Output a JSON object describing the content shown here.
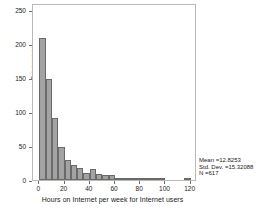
{
  "chart_data": {
    "type": "bar",
    "subtype": "histogram",
    "title": "",
    "xlabel": "Hours on Internet per week for Internet users",
    "ylabel": "Frequency",
    "xlim": [
      -5,
      125
    ],
    "ylim": [
      0,
      260
    ],
    "bin_width": 5,
    "grid": false,
    "legend": null,
    "xticks": [
      0,
      20,
      40,
      60,
      80,
      100,
      120
    ],
    "xtick_labels": [
      "0",
      "20",
      "40",
      "60",
      "80",
      "100",
      "120"
    ],
    "yticks": [
      0,
      50,
      100,
      150,
      200,
      250
    ],
    "ytick_labels": [
      "0",
      "50",
      "100",
      "150",
      "200",
      "250"
    ],
    "bin_starts": [
      0,
      5,
      10,
      15,
      20,
      25,
      30,
      35,
      40,
      45,
      50,
      55,
      60,
      65,
      70,
      75,
      80,
      85,
      90,
      95,
      100,
      105,
      110,
      115,
      120
    ],
    "categories": [
      "0-5",
      "5-10",
      "10-15",
      "15-20",
      "20-25",
      "25-30",
      "30-35",
      "35-40",
      "40-45",
      "45-50",
      "50-55",
      "55-60",
      "60-65",
      "65-70",
      "70-75",
      "75-80",
      "80-85",
      "85-90",
      "90-95",
      "95-100",
      "100-105",
      "105-110",
      "110-115",
      "115-120",
      "120-125"
    ],
    "values": [
      208,
      149,
      91,
      48,
      30,
      22,
      17,
      11,
      16,
      9,
      8,
      7,
      2,
      1,
      3,
      1,
      1,
      1,
      3,
      3,
      0,
      0,
      0,
      1,
      0
    ],
    "bar_color": "#a3a3a3",
    "bar_edge_color": "#6a6a6a"
  },
  "stats": {
    "mean_label": "Mean =12.8253",
    "stddev_label": "Std. Dev. =15.32088",
    "n_label": "N =617"
  }
}
